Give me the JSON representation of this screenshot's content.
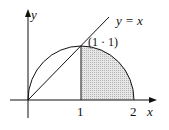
{
  "diagram": {
    "axis_x_label": "x",
    "axis_y_label": "y",
    "line_label": "y = x",
    "point_label": "(1 · 1)",
    "tick_1": "1",
    "tick_2": "2",
    "shaded_region": "area under semicircle from x=1 to x=2",
    "colors": {
      "stroke": "#111111",
      "hatch": "#bbbbbb"
    }
  }
}
